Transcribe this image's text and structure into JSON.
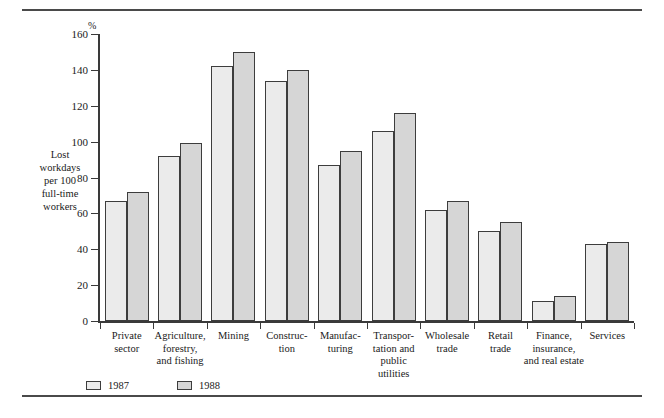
{
  "chart_data": {
    "type": "bar",
    "title": "",
    "xlabel": "",
    "ylabel": "Lost\nworkdays\nper 100\nfull-time\nworkers",
    "unit_symbol": "%",
    "ylim": [
      0,
      160
    ],
    "yticks": [
      0,
      20,
      40,
      60,
      80,
      100,
      120,
      140,
      160
    ],
    "ytick_labels": [
      "0",
      "20",
      "40",
      "60",
      "80",
      "100",
      "120",
      "140",
      "160"
    ],
    "grid": false,
    "legend_position": "bottom-left",
    "categories": [
      "Private\nsector",
      "Agriculture,\nforestry,\nand fishing",
      "Mining",
      "Construc-\ntion",
      "Manufac-\nturing",
      "Transpor-\ntation and\npublic\nutilities",
      "Wholesale\ntrade",
      "Retail\ntrade",
      "Finance,\ninsurance,\nand real estate",
      "Services"
    ],
    "series": [
      {
        "name": "1987",
        "color": "#ebebeb",
        "values": [
          67,
          92,
          142,
          134,
          87,
          106,
          62,
          50,
          11,
          43
        ]
      },
      {
        "name": "1988",
        "color": "#d6d6d6",
        "values": [
          72,
          99,
          150,
          140,
          95,
          116,
          67,
          55,
          14,
          44
        ]
      }
    ]
  },
  "legend": {
    "items": [
      {
        "label": "1987",
        "swatch": "light-gray-swatch"
      },
      {
        "label": "1988",
        "swatch": "dark-gray-swatch"
      }
    ]
  }
}
